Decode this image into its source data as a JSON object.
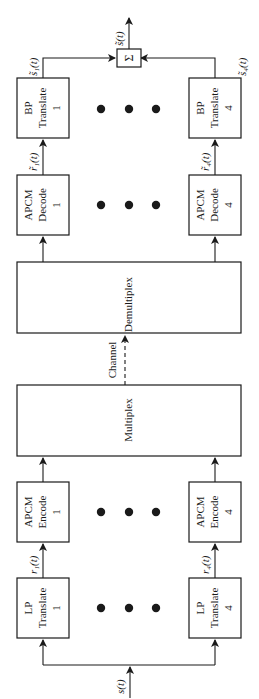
{
  "diagram": {
    "type": "block-diagram",
    "orientation": "rotated-90-ccw",
    "input_signal": "s(t)",
    "output_signal": "s̃(t)",
    "summer_symbol": "Σ",
    "channel_label": "Channel",
    "ellipsis": "• • •",
    "branches": [
      {
        "id": 1,
        "lp_translate": {
          "line1": "LP",
          "line2": "Translate",
          "line3": "1"
        },
        "lp_output": "r₁(t)",
        "apcm_encode": {
          "line1": "APCM",
          "line2": "Encode",
          "line3": "1"
        },
        "apcm_decode": {
          "line1": "APCM",
          "line2": "Decode",
          "line3": "1"
        },
        "decode_output": "r̃₁(t)",
        "bp_translate": {
          "line1": "BP",
          "line2": "Translate",
          "line3": "1"
        },
        "bp_output": "s̃₁(t)"
      },
      {
        "id": 4,
        "lp_translate": {
          "line1": "LP",
          "line2": "Translate",
          "line3": "4"
        },
        "lp_output": "r₄(t)",
        "apcm_encode": {
          "line1": "APCM",
          "line2": "Encode",
          "line3": "4"
        },
        "apcm_decode": {
          "line1": "APCM",
          "line2": "Decode",
          "line3": "4"
        },
        "decode_output": "r̃₄(t)",
        "bp_translate": {
          "line1": "BP",
          "line2": "Translate",
          "line3": "4"
        },
        "bp_output": "s̃₄(t)"
      }
    ],
    "multiplex": {
      "label": "Multiplex"
    },
    "demultiplex": {
      "label": "Demultiplex"
    },
    "colors": {
      "ink": "#1a1a1a",
      "background": "#ffffff"
    }
  }
}
